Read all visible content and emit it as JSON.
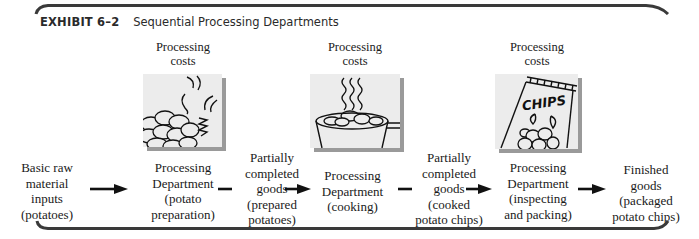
{
  "exhibit": {
    "number": "EXHIBIT 6–2",
    "title": "Sequential Processing Departments"
  },
  "processing_costs": [
    {
      "line1": "Processing",
      "line2": "costs"
    },
    {
      "line1": "Processing",
      "line2": "costs"
    },
    {
      "line1": "Processing",
      "line2": "costs"
    }
  ],
  "illustrations": [
    {
      "icon": "raw-potatoes-icon",
      "description": "pile of potatoes with peels"
    },
    {
      "icon": "cooking-pot-icon",
      "description": "pot of potato chips cooking with steam"
    },
    {
      "icon": "chips-bag-icon",
      "description": "bag of chips",
      "text": "CHIPS"
    }
  ],
  "flow": [
    {
      "lines": [
        "Basic raw",
        "material",
        "inputs",
        "(potatoes)"
      ]
    },
    {
      "lines": [
        "Processing",
        "Department",
        "(potato",
        "preparation)"
      ]
    },
    {
      "lines": [
        "Partially",
        "completed",
        "goods",
        "(prepared",
        "potatoes)"
      ]
    },
    {
      "lines": [
        "Processing",
        "Department",
        "(cooking)"
      ]
    },
    {
      "lines": [
        "Partially",
        "completed",
        "goods",
        "(cooked",
        "potato chips)"
      ]
    },
    {
      "lines": [
        "Processing",
        "Department",
        "(inspecting",
        "and packing)"
      ]
    },
    {
      "lines": [
        "Finished",
        "goods",
        "(packaged",
        "potato chips)"
      ]
    }
  ],
  "colors": {
    "bracket": "#3a3a3a",
    "illustration_bg": "#ececec",
    "shadow": "#9a9a9a",
    "text": "#1a1a1a"
  }
}
